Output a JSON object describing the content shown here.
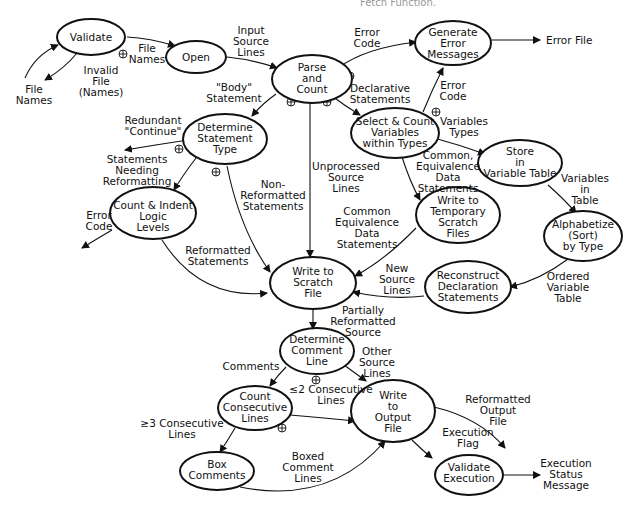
{
  "caption": "Fetch Function.",
  "nodes": [
    {
      "id": "validate",
      "lines": [
        "Validate"
      ]
    },
    {
      "id": "open",
      "lines": [
        "Open"
      ]
    },
    {
      "id": "parse",
      "lines": [
        "Parse",
        "and",
        "Count"
      ]
    },
    {
      "id": "gen_err",
      "lines": [
        "Generate",
        "Error",
        "Messages"
      ]
    },
    {
      "id": "det_stmt",
      "lines": [
        "Determine",
        "Statement",
        "Type"
      ]
    },
    {
      "id": "select",
      "lines": [
        "Select & Count",
        "Variables",
        "within Types"
      ]
    },
    {
      "id": "store",
      "lines": [
        "Store",
        "in",
        "Variable Table"
      ]
    },
    {
      "id": "count_indent",
      "lines": [
        "Count & Indent",
        "Logic",
        "Levels"
      ]
    },
    {
      "id": "write_temp",
      "lines": [
        "Write to",
        "Temporary",
        "Scratch",
        "Files"
      ]
    },
    {
      "id": "alpha",
      "lines": [
        "Alphabetize",
        "(Sort)",
        "by Type"
      ]
    },
    {
      "id": "write_scratch",
      "lines": [
        "Write to",
        "Scratch",
        "File"
      ]
    },
    {
      "id": "reconstruct",
      "lines": [
        "Reconstruct",
        "Declaration",
        "Statements"
      ]
    },
    {
      "id": "det_comment",
      "lines": [
        "Determine",
        "Comment",
        "Line"
      ]
    },
    {
      "id": "count_consec",
      "lines": [
        "Count",
        "Consecutive",
        "Lines"
      ]
    },
    {
      "id": "write_output",
      "lines": [
        "Write",
        "to",
        "Output",
        "File"
      ]
    },
    {
      "id": "box",
      "lines": [
        "Box",
        "Comments"
      ]
    },
    {
      "id": "validate_exec",
      "lines": [
        "Validate",
        "Execution"
      ]
    }
  ],
  "labels": {
    "file_names_in": [
      "File",
      "Names"
    ],
    "invalid_file": [
      "Invalid",
      "File",
      "(Names)"
    ],
    "file_names": [
      "File",
      "Names"
    ],
    "input_source": [
      "Input",
      "Source",
      "Lines"
    ],
    "error_code_top": [
      "Error",
      "Code"
    ],
    "error_file": [
      "Error File"
    ],
    "body_statement": [
      "\"Body\"",
      "Statement"
    ],
    "declarative": [
      "Declarative",
      "Statements"
    ],
    "error_code_mid": [
      "Error",
      "Code"
    ],
    "variables_types": [
      "Variables",
      "Types"
    ],
    "redundant": [
      "Redundant",
      "\"Continue\""
    ],
    "needing_reformat": [
      "Statements",
      "Needing",
      "Reformatting"
    ],
    "common_equiv_1": [
      "Common,",
      "Equivalence",
      "Data",
      "Statements"
    ],
    "variables_in_table": [
      "Variables",
      "in",
      "Table"
    ],
    "unprocessed": [
      "Unprocessed",
      "Source",
      "Lines"
    ],
    "non_reformatted": [
      "Non-",
      "Reformatted",
      "Statements"
    ],
    "error_code_left": [
      "Error",
      "Code"
    ],
    "common_equiv_2": [
      "Common",
      "Equivalence",
      "Data",
      "Statements"
    ],
    "reformatted_stmts": [
      "Reformatted",
      "Statements"
    ],
    "new_source": [
      "New",
      "Source",
      "Lines"
    ],
    "ordered_table": [
      "Ordered",
      "Variable",
      "Table"
    ],
    "partially": [
      "Partially",
      "Reformatted",
      "Source"
    ],
    "comments": [
      "Comments"
    ],
    "other_source": [
      "Other",
      "Source",
      "Lines"
    ],
    "le2": [
      "≤2 Consecutive",
      "Lines"
    ],
    "ge3": [
      "≥3 Consecutive",
      "Lines"
    ],
    "reformatted_output": [
      "Reformatted",
      "Output",
      "File"
    ],
    "exec_flag": [
      "Execution",
      "Flag"
    ],
    "boxed": [
      "Boxed",
      "Comment",
      "Lines"
    ],
    "exec_status": [
      "Execution",
      "Status",
      "Message"
    ]
  }
}
